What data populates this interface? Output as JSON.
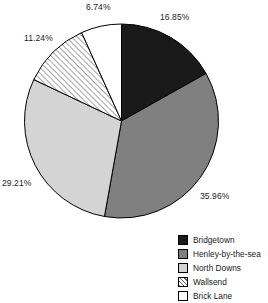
{
  "chart_data": {
    "type": "pie",
    "title": "",
    "labels": [
      "Bridgetown",
      "Henley-by-the-sea",
      "North Downs",
      "Wallsend",
      "Brick Lane"
    ],
    "values": [
      16.85,
      35.96,
      29.21,
      11.24,
      6.74
    ],
    "value_labels": [
      "16.85%",
      "35.96%",
      "29.21%",
      "11.24%",
      "6.74%"
    ],
    "unit": "%",
    "legend_position": "bottom-right",
    "grid": false,
    "start_angle_deg": 0,
    "direction": "clockwise",
    "slices": [
      {
        "label": "Bridgetown",
        "value": 16.85,
        "value_label": "16.85%",
        "color": "#1a1a1a",
        "fill": "solid",
        "start_deg": 0,
        "end_deg": 60.66
      },
      {
        "label": "Henley-by-the-sea",
        "value": 35.96,
        "value_label": "35.96%",
        "color": "#808080",
        "fill": "solid",
        "start_deg": 60.66,
        "end_deg": 190.12
      },
      {
        "label": "North Downs",
        "value": 29.21,
        "value_label": "29.21%",
        "color": "#d4d4d4",
        "fill": "solid",
        "start_deg": 190.12,
        "end_deg": 295.28
      },
      {
        "label": "Wallsend",
        "value": 11.24,
        "value_label": "11.24%",
        "color": "#ffffff",
        "fill": "diagonal-hatch",
        "start_deg": 295.28,
        "end_deg": 335.74
      },
      {
        "label": "Brick Lane",
        "value": 6.74,
        "value_label": "6.74%",
        "color": "#ffffff",
        "fill": "solid",
        "start_deg": 335.74,
        "end_deg": 360
      }
    ]
  },
  "legend": {
    "items": [
      {
        "label": "Bridgetown"
      },
      {
        "label": "Henley-by-the-sea"
      },
      {
        "label": "North Downs"
      },
      {
        "label": "Wallsend"
      },
      {
        "label": "Brick Lane"
      }
    ]
  },
  "colors": {
    "slice_bridgetown": "#1a1a1a",
    "slice_henley": "#808080",
    "slice_north_downs": "#d4d4d4",
    "slice_wallsend": "#ffffff",
    "slice_brick_lane": "#ffffff",
    "outline": "#000000",
    "text": "#1a1a1a",
    "background": "#ffffff"
  }
}
